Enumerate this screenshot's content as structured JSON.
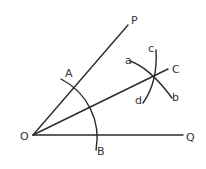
{
  "diagram": {
    "colors": {
      "line": "#2b2b2b",
      "text": "#333333",
      "background": "#ffffff"
    },
    "points": {
      "O": {
        "label": "O"
      },
      "P": {
        "label": "P"
      },
      "Q": {
        "label": "Q"
      },
      "A": {
        "label": "A"
      },
      "B": {
        "label": "B"
      },
      "C": {
        "label": "C"
      },
      "a": {
        "label": "a"
      },
      "b": {
        "label": "b"
      },
      "c": {
        "label": "c"
      },
      "d": {
        "label": "d"
      }
    },
    "rays": [
      "OP",
      "OQ",
      "OC"
    ],
    "arcs": [
      "AB (centered at O)",
      "ab",
      "cd"
    ]
  }
}
